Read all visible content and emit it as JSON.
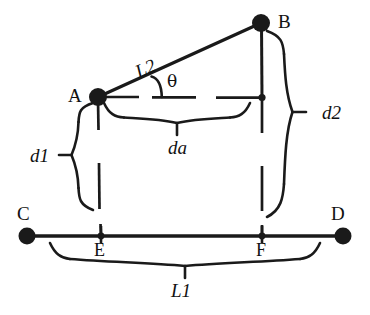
{
  "figure": {
    "type": "geometry-diagram",
    "stroke_color": "#1a1a1a",
    "background_color": "#ffffff"
  },
  "points": {
    "A": {
      "label": "A",
      "x": 98,
      "y": 97,
      "marker": "filled-circle-large",
      "label_x": 68,
      "label_y": 86
    },
    "B": {
      "label": "B",
      "x": 261,
      "y": 23,
      "marker": "filled-circle-large",
      "label_x": 278,
      "label_y": 12
    },
    "C": {
      "label": "C",
      "x": 27,
      "y": 236,
      "marker": "filled-circle-large",
      "label_x": 17,
      "label_y": 204
    },
    "D": {
      "label": "D",
      "x": 343,
      "y": 236,
      "marker": "filled-circle-large",
      "label_x": 331,
      "label_y": 204
    },
    "E": {
      "label": "E",
      "x": 101,
      "y": 236,
      "marker": "filled-circle-small",
      "label_x": 94,
      "label_y": 241
    },
    "F": {
      "label": "F",
      "x": 262,
      "y": 236,
      "marker": "filled-circle-small",
      "label_x": 256,
      "label_y": 241
    },
    "G": {
      "label": "",
      "x": 262,
      "y": 97,
      "marker": "filled-circle-small",
      "label_x": 0,
      "label_y": 0
    }
  },
  "dimensions": [
    {
      "key": "L2",
      "label": "L2",
      "style": "italic-serif",
      "rotated": true,
      "rotation_deg": -24,
      "x": 140,
      "y": 62,
      "measures": "A-to-B slanted beam"
    },
    {
      "key": "L1",
      "label": "L1",
      "style": "italic-serif",
      "rotated": false,
      "x": 171,
      "y": 281,
      "measures": "C-to-D baseline span"
    },
    {
      "key": "d1",
      "label": "d1",
      "style": "italic-serif",
      "rotated": false,
      "x": 30,
      "y": 155,
      "measures": "A-to-E vertical offset"
    },
    {
      "key": "d2",
      "label": "d2",
      "style": "italic-serif",
      "rotated": false,
      "x": 322,
      "y": 115,
      "measures": "B-to-F vertical offset"
    },
    {
      "key": "da",
      "label": "da",
      "style": "italic-serif",
      "rotated": false,
      "x": 168,
      "y": 147,
      "measures": "A-to-BF horizontal span"
    }
  ],
  "angles": [
    {
      "key": "theta",
      "label": "θ",
      "x": 167,
      "y": 73,
      "vertex": "A",
      "between": [
        "A-B",
        "A-horizontal"
      ]
    }
  ]
}
